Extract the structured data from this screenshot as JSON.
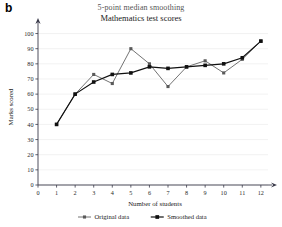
{
  "panel": {
    "label": "b"
  },
  "titles": {
    "suptitle": "5-point median smoothing",
    "subtitle": "Mathematics test scores"
  },
  "chart_data": {
    "type": "line",
    "title": "Mathematics test scores",
    "subtitle": "5-point median smoothing",
    "xlabel": "Number of students",
    "ylabel": "Marks scored",
    "xlim": [
      0,
      12.6
    ],
    "ylim": [
      0,
      103
    ],
    "grid": true,
    "legend_position": "bottom",
    "xticks": [
      0,
      1,
      2,
      3,
      4,
      5,
      6,
      7,
      8,
      9,
      10,
      11,
      12
    ],
    "xticklabels": [
      "0",
      "1",
      "2",
      "3",
      "4",
      "5",
      "6",
      "7",
      "8",
      "9",
      "10",
      "11",
      "12"
    ],
    "yticks": [
      0,
      10,
      20,
      30,
      40,
      50,
      60,
      70,
      80,
      90,
      100
    ],
    "yticklabels": [
      "0",
      "10",
      "20",
      "30",
      "40",
      "50",
      "60",
      "70",
      "80",
      "90",
      "100"
    ],
    "x": [
      1,
      2,
      3,
      4,
      5,
      6,
      7,
      8,
      9,
      10,
      11,
      12
    ],
    "series": [
      {
        "name": "Original data",
        "color": "#5a5a5a",
        "marker": "square",
        "values": [
          40,
          60,
          73,
          67,
          90,
          80,
          65,
          78,
          82,
          74,
          83,
          95
        ]
      },
      {
        "name": "Smoothed data",
        "color": "#101010",
        "marker": "square",
        "values": [
          40,
          60,
          68,
          73,
          74,
          78,
          77,
          78,
          79,
          80,
          84,
          95
        ]
      }
    ]
  },
  "legend": {
    "items": [
      {
        "label": "Original data",
        "color": "#5a5a5a"
      },
      {
        "label": "Smoothed data",
        "color": "#101010"
      }
    ]
  }
}
